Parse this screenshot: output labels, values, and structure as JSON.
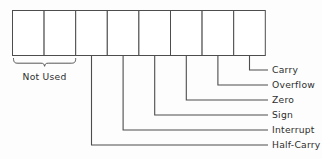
{
  "diagram": {
    "register": {
      "name": "status-register",
      "bit_count": 8,
      "cells": [
        {
          "index": 0,
          "label": "",
          "flag": null
        },
        {
          "index": 1,
          "label": "",
          "flag": null
        },
        {
          "index": 2,
          "label": "",
          "flag": "Half-Carry"
        },
        {
          "index": 3,
          "label": "",
          "flag": "Interrupt"
        },
        {
          "index": 4,
          "label": "",
          "flag": "Sign"
        },
        {
          "index": 5,
          "label": "",
          "flag": "Zero"
        },
        {
          "index": 6,
          "label": "",
          "flag": "Overflow"
        },
        {
          "index": 7,
          "label": "",
          "flag": "Carry"
        }
      ]
    },
    "group_labels": [
      {
        "text": "Not Used",
        "spans_cells": [
          0,
          1
        ]
      }
    ],
    "callouts": [
      {
        "label": "Carry",
        "cell": 7,
        "row": 0
      },
      {
        "label": "Overflow",
        "cell": 6,
        "row": 1
      },
      {
        "label": "Zero",
        "cell": 5,
        "row": 2
      },
      {
        "label": "Sign",
        "cell": 4,
        "row": 3
      },
      {
        "label": "Interrupt",
        "cell": 3,
        "row": 4
      },
      {
        "label": "Half-Carry",
        "cell": 2,
        "row": 5
      }
    ],
    "colors": {
      "background": "#fdfdfd",
      "line": "#4d4d4d",
      "cell_fill": "#ffffff",
      "text": "#2e2e2e"
    }
  }
}
